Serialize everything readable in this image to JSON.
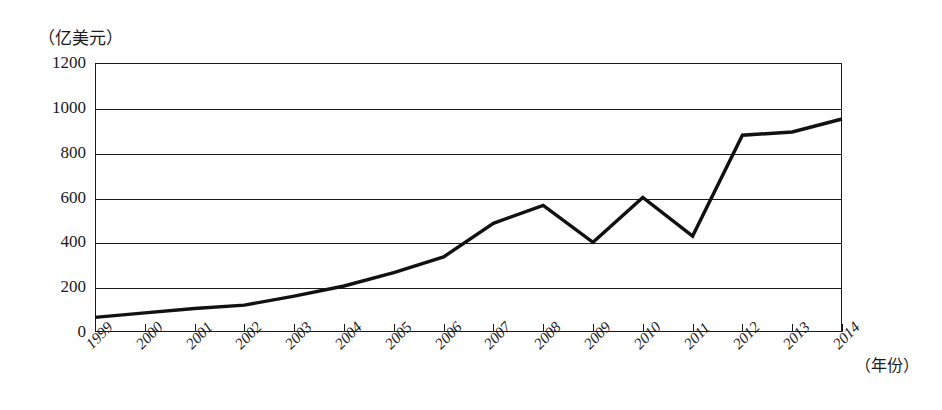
{
  "chart_data": {
    "type": "line",
    "title": "",
    "ylabel": "（亿美元）",
    "xlabel": "（年份）",
    "grid": true,
    "legend": false,
    "ylim": [
      0,
      1200
    ],
    "yticks": [
      0,
      200,
      400,
      600,
      800,
      1000,
      1200
    ],
    "ytick_labels": [
      "0",
      "200",
      "400",
      "600",
      "800",
      "1000",
      "1200"
    ],
    "categories": [
      "1999",
      "2000",
      "2001",
      "2002",
      "2003",
      "2004",
      "2005",
      "2006",
      "2007",
      "2008",
      "2009",
      "2010",
      "2011",
      "2012",
      "2013",
      "2014"
    ],
    "values": [
      65,
      85,
      105,
      120,
      160,
      205,
      265,
      335,
      485,
      565,
      400,
      600,
      428,
      878,
      892,
      950
    ],
    "series": [
      {
        "name": "",
        "values": [
          65,
          85,
          105,
          120,
          160,
          205,
          265,
          335,
          485,
          565,
          400,
          600,
          428,
          878,
          892,
          950
        ]
      }
    ],
    "line_color": "#111111",
    "line_width": 3.4
  },
  "axis": {
    "y_unit_caption": "（亿美元）",
    "x_unit_caption": "（年份）"
  }
}
